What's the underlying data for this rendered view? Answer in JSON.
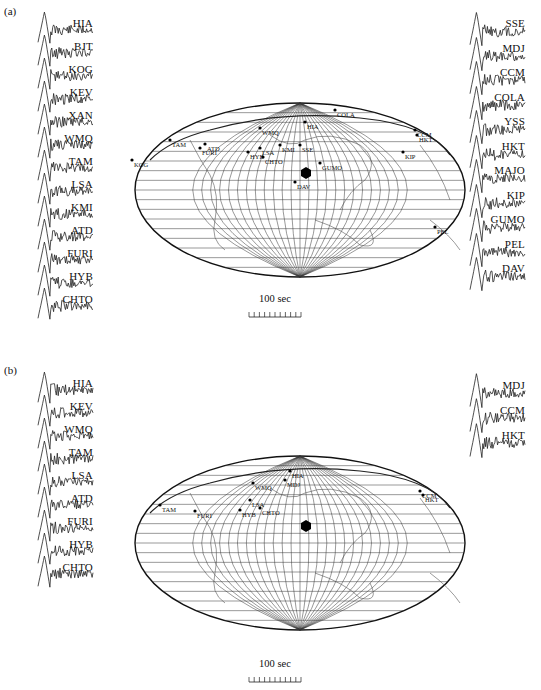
{
  "figure": {
    "panels": [
      {
        "label": "(a)",
        "left_traces": [
          "HIA",
          "BJT",
          "KOG",
          "KEV",
          "XAN",
          "WMQ",
          "TAM",
          "LSA",
          "KMI",
          "ATD",
          "FURI",
          "HYB",
          "CHTO"
        ],
        "right_traces": [
          "SSE",
          "MDJ",
          "CCM",
          "COLA",
          "YSS",
          "HKT",
          "MAJO",
          "KIP",
          "GUMO",
          "PEL",
          "DAV"
        ],
        "map_stations": [
          "HIA",
          "BJT",
          "KOG",
          "KEV",
          "XAN",
          "WMQ",
          "TAM",
          "LSA",
          "KMI",
          "ATD",
          "FURI",
          "HYB",
          "CHTO",
          "SSE",
          "MDJ",
          "CCM",
          "COLA",
          "YSS",
          "HKT",
          "MAJO",
          "KIP",
          "GUMO",
          "PEL",
          "DAV"
        ],
        "scale_label": "100 sec"
      },
      {
        "label": "(b)",
        "left_traces": [
          "HIA",
          "KEV",
          "WMQ",
          "TAM",
          "LSA",
          "ATD",
          "FURI",
          "HYB",
          "CHTO"
        ],
        "right_traces": [
          "MDJ",
          "CCM",
          "HKT"
        ],
        "map_stations": [
          "HIA",
          "KEV",
          "WMQ",
          "TAM",
          "LSA",
          "ATD",
          "FURI",
          "HYB",
          "CHTO",
          "MDJ",
          "CCM",
          "HKT"
        ],
        "scale_label": "100 sec"
      }
    ],
    "map_labels_a": {
      "KOG": "KOG",
      "TAM": "TAM",
      "FURI": "FURI",
      "HYB": "HYB",
      "LSA": "LSA",
      "CHTO": "CHTO",
      "WMQ": "WMQ",
      "KMI": "KMI",
      "SSE": "SSE",
      "GUMO": "GUMO",
      "DAV": "DAV",
      "KIP": "KIP",
      "CCM": "CCM",
      "HKT": "HKT",
      "PEL": "PEL",
      "COLA": "COLA",
      "ATD": "ATD",
      "HIA": "HIA"
    },
    "map_labels_b": {
      "TAM": "TAM",
      "FURI": "FURI",
      "HYB": "HYB",
      "LSA": "LSA",
      "CHTO": "CHTO",
      "WMQ": "WMQ",
      "MDJ": "MDJ",
      "CCM": "CCM",
      "HKT": "HKT",
      "HIA": "HIA"
    }
  }
}
